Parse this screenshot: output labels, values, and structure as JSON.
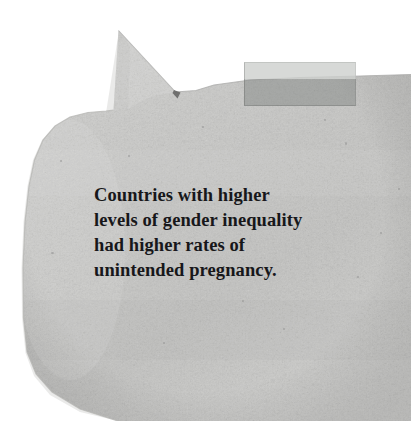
{
  "scene": {
    "width": 411,
    "height": 421,
    "background_color": "#ffffff",
    "description": "Torn grey paper speech bubble with tape, bearing a printed quotation"
  },
  "paper": {
    "name": "torn-paper-speech-bubble",
    "fill_color": "#c8c8c6",
    "edge_shadow_color": "#b3b3b1",
    "texture": "fibrous-paper-grain",
    "tail": {
      "name": "speech-bubble-tail",
      "apex_x": 118,
      "apex_y": 30
    }
  },
  "tape": {
    "name": "adhesive-tape-strip",
    "x": 244,
    "y": 62,
    "width": 112,
    "height": 44,
    "upper_color": "#cdcfcd",
    "lower_color": "#8a8d8b",
    "opacity": "semi-transparent"
  },
  "quote": {
    "name": "quote-text",
    "full_text": "Countries with higher levels of gender inequality had higher rates of unintended pregnancy.",
    "lines": [
      "Countries with higher",
      "levels of gender inequality",
      "had higher rates of",
      "unintended pregnancy."
    ],
    "text_color": "#17171a",
    "font_weight": "bold",
    "font_style": "serif"
  }
}
